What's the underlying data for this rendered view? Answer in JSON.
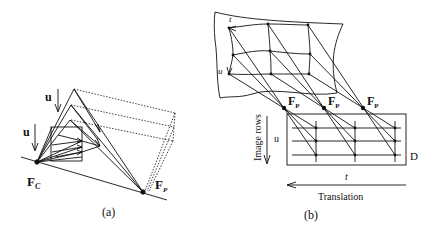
{
  "panel_a": {
    "caption": "(a)",
    "labels": {
      "u_upper": "u",
      "u_lower": "u",
      "fc_main": "F",
      "fc_sub": "C",
      "fp_main": "F",
      "fp_sub": "P"
    }
  },
  "panel_b": {
    "caption": "(b)",
    "labels": {
      "sheet_t": "t",
      "sheet_u": "u",
      "fp_main": "F",
      "fp_sub": "P",
      "image_rows": "Image rows",
      "u": "u",
      "d": "D",
      "t": "t",
      "translation": "Translation"
    }
  },
  "colors": {
    "ink": "#111111",
    "background": "#ffffff"
  }
}
